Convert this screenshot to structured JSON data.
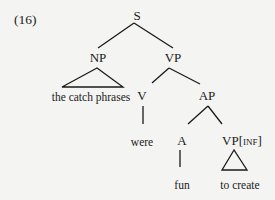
{
  "example_number": "(16)",
  "tree": {
    "root": "S",
    "np": {
      "label": "NP",
      "leaf": "the catch phrases"
    },
    "vp": {
      "label": "VP",
      "v": {
        "label": "V",
        "leaf": "were"
      },
      "ap": {
        "label": "AP",
        "a": {
          "label": "A",
          "leaf": "fun"
        },
        "vpinf": {
          "label": "VP",
          "feature": "INF",
          "open": "[",
          "close": "]",
          "leaf": "to create"
        }
      }
    }
  }
}
